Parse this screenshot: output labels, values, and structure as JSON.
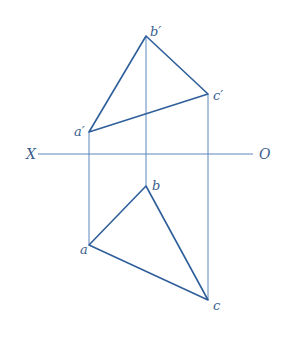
{
  "diagram": {
    "colors": {
      "edge": "#2f5f9a",
      "projector": "#5a86bd",
      "label": "#3a5f8f",
      "background": "#ffffff"
    },
    "axis": {
      "left_label": "X",
      "right_label": "O",
      "x1": 38,
      "x2": 253,
      "y": 154
    },
    "front_view": {
      "points": {
        "a_prime": {
          "label": "a′",
          "x": 89,
          "y": 132
        },
        "b_prime": {
          "label": "b′",
          "x": 146,
          "y": 36
        },
        "c_prime": {
          "label": "c′",
          "x": 208,
          "y": 94
        }
      }
    },
    "top_view": {
      "points": {
        "a": {
          "label": "a",
          "x": 89,
          "y": 245
        },
        "b": {
          "label": "b",
          "x": 146,
          "y": 186
        },
        "c": {
          "label": "c",
          "x": 208,
          "y": 300
        }
      }
    }
  }
}
